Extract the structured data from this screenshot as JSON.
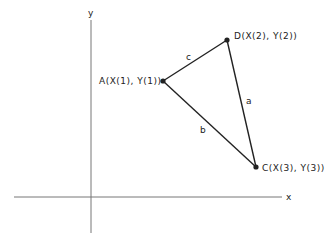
{
  "diagram": {
    "axes": {
      "x_label": "x",
      "y_label": "y"
    },
    "points": {
      "A": {
        "label": "A(X(1), Y(1))",
        "px": [
          163,
          81
        ]
      },
      "D": {
        "label": "D(X(2), Y(2))",
        "px": [
          227,
          40
        ]
      },
      "C": {
        "label": "C(X(3), Y(3))",
        "px": [
          256,
          167
        ]
      }
    },
    "sides": {
      "a": "a",
      "b": "b",
      "c": "c"
    },
    "colors": {
      "ink": "#222222",
      "axis": "#777777"
    }
  }
}
